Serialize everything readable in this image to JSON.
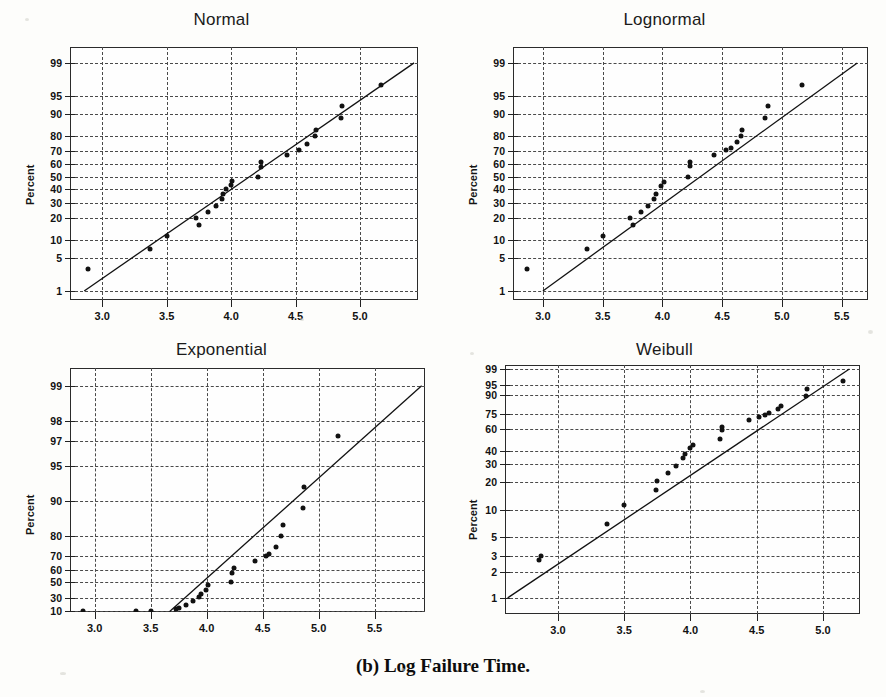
{
  "figure": {
    "caption": "(b) Log Failure Time.",
    "background_color": "#fdfdfb",
    "ink_color": "#111111"
  },
  "chart_data": [
    {
      "type": "scatter",
      "title": "Normal",
      "xlabel": "",
      "ylabel": "Percent",
      "grid": true,
      "legend": "none",
      "xticks": [
        "3.0",
        "3.5",
        "4.0",
        "4.5",
        "5.0"
      ],
      "xtick_values": [
        3.0,
        3.5,
        4.0,
        4.5,
        5.0
      ],
      "xlim": [
        2.75,
        5.45
      ],
      "yticks": [
        "1",
        "5",
        "10",
        "20",
        "30",
        "40",
        "50",
        "60",
        "70",
        "80",
        "90",
        "95",
        "99"
      ],
      "ytick_values": [
        1,
        5,
        10,
        20,
        30,
        40,
        50,
        60,
        70,
        80,
        90,
        95,
        99
      ],
      "y_scale": "normal-probability",
      "ylim": [
        0.6,
        99.6
      ],
      "points": [
        {
          "x": 2.89,
          "y": 3.0
        },
        {
          "x": 3.37,
          "y": 7.0
        },
        {
          "x": 3.5,
          "y": 11.5
        },
        {
          "x": 3.73,
          "y": 20.0
        },
        {
          "x": 3.75,
          "y": 16.5
        },
        {
          "x": 3.82,
          "y": 24.0
        },
        {
          "x": 3.88,
          "y": 28.0
        },
        {
          "x": 3.93,
          "y": 32.5
        },
        {
          "x": 3.94,
          "y": 36.5
        },
        {
          "x": 3.96,
          "y": 40.0
        },
        {
          "x": 4.0,
          "y": 43.5
        },
        {
          "x": 4.01,
          "y": 46.5
        },
        {
          "x": 4.21,
          "y": 50.0
        },
        {
          "x": 4.23,
          "y": 58.0
        },
        {
          "x": 4.23,
          "y": 62.0
        },
        {
          "x": 4.43,
          "y": 67.5
        },
        {
          "x": 4.53,
          "y": 71.0
        },
        {
          "x": 4.59,
          "y": 75.0
        },
        {
          "x": 4.65,
          "y": 79.5
        },
        {
          "x": 4.66,
          "y": 83.0
        },
        {
          "x": 4.85,
          "y": 88.5
        },
        {
          "x": 4.86,
          "y": 92.5
        },
        {
          "x": 5.16,
          "y": 97.0
        }
      ],
      "fit_line": {
        "x1": 2.86,
        "y1": 1.0,
        "x2": 5.42,
        "y2": 99.0
      }
    },
    {
      "type": "scatter",
      "title": "Lognormal",
      "xlabel": "",
      "ylabel": "Percent",
      "grid": true,
      "legend": "none",
      "xticks": [
        "3.0",
        "3.5",
        "4.0",
        "4.5",
        "5.0",
        "5.5"
      ],
      "xtick_values": [
        3.0,
        3.5,
        4.0,
        4.5,
        5.0,
        5.5
      ],
      "xlim": [
        2.75,
        5.72
      ],
      "yticks": [
        "1",
        "5",
        "10",
        "20",
        "30",
        "40",
        "50",
        "60",
        "70",
        "80",
        "90",
        "95",
        "99"
      ],
      "ytick_values": [
        1,
        5,
        10,
        20,
        30,
        40,
        50,
        60,
        70,
        80,
        90,
        95,
        99
      ],
      "y_scale": "normal-probability",
      "ylim": [
        0.6,
        99.6
      ],
      "points": [
        {
          "x": 2.87,
          "y": 3.0
        },
        {
          "x": 3.37,
          "y": 7.0
        },
        {
          "x": 3.5,
          "y": 11.5
        },
        {
          "x": 3.73,
          "y": 20.0
        },
        {
          "x": 3.75,
          "y": 16.5
        },
        {
          "x": 3.82,
          "y": 24.0
        },
        {
          "x": 3.88,
          "y": 28.0
        },
        {
          "x": 3.93,
          "y": 32.5
        },
        {
          "x": 3.95,
          "y": 36.5
        },
        {
          "x": 3.99,
          "y": 43.0
        },
        {
          "x": 4.01,
          "y": 46.0
        },
        {
          "x": 4.21,
          "y": 50.0
        },
        {
          "x": 4.23,
          "y": 58.5
        },
        {
          "x": 4.23,
          "y": 62.0
        },
        {
          "x": 4.43,
          "y": 67.0
        },
        {
          "x": 4.53,
          "y": 71.0
        },
        {
          "x": 4.57,
          "y": 72.5
        },
        {
          "x": 4.62,
          "y": 76.0
        },
        {
          "x": 4.66,
          "y": 79.5
        },
        {
          "x": 4.67,
          "y": 83.0
        },
        {
          "x": 4.86,
          "y": 88.5
        },
        {
          "x": 4.88,
          "y": 92.5
        },
        {
          "x": 5.17,
          "y": 97.0
        }
      ],
      "fit_line": {
        "x1": 3.0,
        "y1": 1.0,
        "x2": 5.63,
        "y2": 99.0
      }
    },
    {
      "type": "scatter",
      "title": "Exponential",
      "xlabel": "",
      "ylabel": "Percent",
      "grid": true,
      "legend": "none",
      "xticks": [
        "3.0",
        "3.5",
        "4.0",
        "4.5",
        "5.0",
        "5.5"
      ],
      "xtick_values": [
        3.0,
        3.5,
        4.0,
        4.5,
        5.0,
        5.5
      ],
      "xlim": [
        2.78,
        5.95
      ],
      "yticks": [
        "10",
        "30",
        "50",
        "60",
        "70",
        "80",
        "90",
        "95",
        "97",
        "98",
        "99"
      ],
      "ytick_values": [
        10,
        30,
        50,
        60,
        70,
        80,
        90,
        95,
        97,
        98,
        99
      ],
      "y_scale": "exponential-probability",
      "ylim": [
        8.0,
        99.3
      ],
      "points": [
        {
          "x": 2.9,
          "y": 9.5
        },
        {
          "x": 3.37,
          "y": 10.0
        },
        {
          "x": 3.5,
          "y": 10.2
        },
        {
          "x": 3.73,
          "y": 13.0
        },
        {
          "x": 3.75,
          "y": 15.5
        },
        {
          "x": 3.82,
          "y": 20.0
        },
        {
          "x": 3.88,
          "y": 26.0
        },
        {
          "x": 3.93,
          "y": 32.0
        },
        {
          "x": 3.95,
          "y": 36.0
        },
        {
          "x": 3.99,
          "y": 41.0
        },
        {
          "x": 4.01,
          "y": 46.5
        },
        {
          "x": 4.22,
          "y": 50.0
        },
        {
          "x": 4.23,
          "y": 58.0
        },
        {
          "x": 4.24,
          "y": 61.5
        },
        {
          "x": 4.43,
          "y": 67.0
        },
        {
          "x": 4.53,
          "y": 70.0
        },
        {
          "x": 4.56,
          "y": 71.0
        },
        {
          "x": 4.62,
          "y": 75.0
        },
        {
          "x": 4.66,
          "y": 80.0
        },
        {
          "x": 4.68,
          "y": 84.0
        },
        {
          "x": 4.86,
          "y": 88.5
        },
        {
          "x": 4.87,
          "y": 92.5
        },
        {
          "x": 5.17,
          "y": 97.3
        }
      ],
      "fit_line": {
        "x1": 3.67,
        "y1": 9.0,
        "x2": 5.92,
        "y2": 99.0
      }
    },
    {
      "type": "scatter",
      "title": "Weibull",
      "xlabel": "",
      "ylabel": "Percent",
      "grid": true,
      "legend": "none",
      "xticks": [
        "3.0",
        "3.5",
        "4.0",
        "4.5",
        "5.0"
      ],
      "xtick_values": [
        3.0,
        3.5,
        4.0,
        4.5,
        5.0
      ],
      "xlim": [
        2.6,
        5.28
      ],
      "yticks": [
        "1",
        "2",
        "3",
        "5",
        "10",
        "20",
        "30",
        "40",
        "60",
        "75",
        "90",
        "95",
        "99"
      ],
      "ytick_values": [
        1,
        2,
        3,
        5,
        10,
        20,
        30,
        40,
        60,
        75,
        90,
        95,
        99
      ],
      "y_scale": "weibull-probability",
      "ylim": [
        0.65,
        99.4
      ],
      "points": [
        {
          "x": 2.86,
          "y": 2.7
        },
        {
          "x": 2.87,
          "y": 3.0
        },
        {
          "x": 3.37,
          "y": 7.0
        },
        {
          "x": 3.5,
          "y": 11.5
        },
        {
          "x": 3.74,
          "y": 16.5
        },
        {
          "x": 3.75,
          "y": 20.5
        },
        {
          "x": 3.83,
          "y": 25.0
        },
        {
          "x": 3.89,
          "y": 29.0
        },
        {
          "x": 3.94,
          "y": 34.5
        },
        {
          "x": 3.96,
          "y": 38.0
        },
        {
          "x": 4.0,
          "y": 43.0
        },
        {
          "x": 4.02,
          "y": 45.5
        },
        {
          "x": 4.22,
          "y": 51.0
        },
        {
          "x": 4.24,
          "y": 59.5
        },
        {
          "x": 4.24,
          "y": 62.5
        },
        {
          "x": 4.44,
          "y": 69.0
        },
        {
          "x": 4.52,
          "y": 72.0
        },
        {
          "x": 4.56,
          "y": 74.0
        },
        {
          "x": 4.59,
          "y": 76.0
        },
        {
          "x": 4.66,
          "y": 79.0
        },
        {
          "x": 4.68,
          "y": 82.0
        },
        {
          "x": 4.87,
          "y": 89.0
        },
        {
          "x": 4.88,
          "y": 93.0
        },
        {
          "x": 5.15,
          "y": 96.5
        }
      ],
      "fit_line": {
        "x1": 2.62,
        "y1": 1.0,
        "x2": 5.2,
        "y2": 99.0
      }
    }
  ]
}
